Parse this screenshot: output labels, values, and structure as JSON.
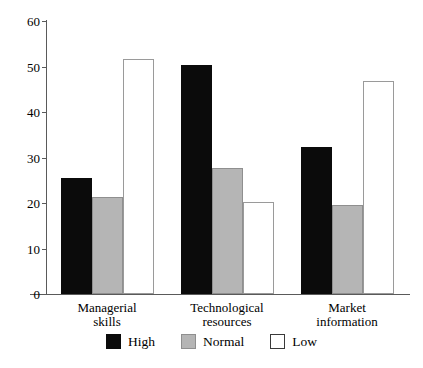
{
  "chart_data": {
    "type": "bar",
    "title": "",
    "subtitle": "",
    "xlabel": "",
    "ylabel": "",
    "ylim": [
      0,
      60
    ],
    "yticks": [
      0,
      10,
      20,
      30,
      40,
      50,
      60
    ],
    "grid": false,
    "legend_position": "bottom-center",
    "categories": [
      "Managerial\nskills",
      "Technological\nresources",
      "Market\ninformation"
    ],
    "series": [
      {
        "name": "High",
        "color": "#0b0b0b",
        "values": [
          25.5,
          50.4,
          32.3
        ]
      },
      {
        "name": "Normal",
        "color": "#b5b5b5",
        "values": [
          21.3,
          27.7,
          19.5
        ]
      },
      {
        "name": "Low",
        "color": "#ffffff",
        "values": [
          51.6,
          20.3,
          46.9
        ]
      }
    ]
  },
  "axis": {
    "tick_labels": [
      "0",
      "10",
      "20",
      "30",
      "40",
      "50",
      "60"
    ]
  },
  "legend": {
    "items": [
      {
        "label": "High"
      },
      {
        "label": "Normal"
      },
      {
        "label": "Low"
      }
    ]
  }
}
